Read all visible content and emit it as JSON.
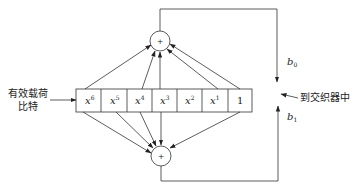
{
  "input_label": {
    "line1": "有效载荷",
    "line2": "比特"
  },
  "output_label": "到交织器中",
  "register": {
    "cells": [
      {
        "base": "x",
        "exp": "6"
      },
      {
        "base": "x",
        "exp": "5"
      },
      {
        "base": "x",
        "exp": "4"
      },
      {
        "base": "x",
        "exp": "3"
      },
      {
        "base": "x",
        "exp": "2"
      },
      {
        "base": "x",
        "exp": "1"
      },
      {
        "base": "1",
        "exp": ""
      }
    ]
  },
  "adders": {
    "top": "+",
    "bottom": "+"
  },
  "outputs": {
    "b0": {
      "base": "b",
      "sub": "0"
    },
    "b1": {
      "base": "b",
      "sub": "1"
    }
  },
  "taps": {
    "top": [
      "x6",
      "x4",
      "x3",
      "x1",
      "1"
    ],
    "bottom": [
      "x6",
      "x5",
      "x4",
      "x3",
      "1"
    ]
  }
}
